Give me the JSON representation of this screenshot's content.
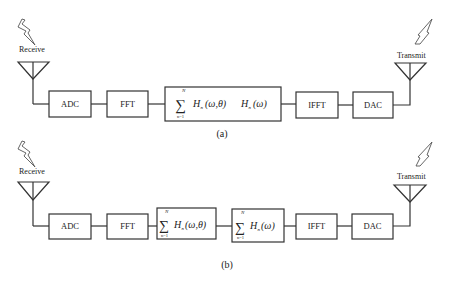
{
  "diagram_a": {
    "caption": "(a)",
    "receive_label": "Receive",
    "transmit_label": "Transmit",
    "blocks": [
      {
        "id": "adc",
        "label": "ADC"
      },
      {
        "id": "fft",
        "label": "FFT"
      },
      {
        "id": "combined_sum",
        "label": "Σ_{n=1}^{N} H_n(ω,θ) H_n(ω)",
        "sum_upper": "N",
        "sum_lower": "n=1",
        "sigma": "∑",
        "term1_H": "H",
        "term1_sub": "n",
        "term1_args": "(ω,θ)",
        "term2_H": "H",
        "term2_sub": "n",
        "term2_args": "(ω)"
      },
      {
        "id": "ifft",
        "label": "IFFT"
      },
      {
        "id": "dac",
        "label": "DAC"
      }
    ]
  },
  "diagram_b": {
    "caption": "(b)",
    "receive_label": "Receive",
    "transmit_label": "Transmit",
    "blocks": [
      {
        "id": "adc",
        "label": "ADC"
      },
      {
        "id": "fft",
        "label": "FFT"
      },
      {
        "id": "sum_theta",
        "label": "Σ_{n=1}^{N} H_n(ω,θ)",
        "sum_upper": "N",
        "sum_lower": "n=1",
        "sigma": "∑",
        "H": "H",
        "sub": "n",
        "args": "(ω,θ)"
      },
      {
        "id": "sum_omega",
        "label": "Σ_{n=1}^{N} H_n(ω)",
        "sum_upper": "N",
        "sum_lower": "n=1",
        "sigma": "∑",
        "H": "H",
        "sub": "n",
        "args": "(ω)"
      },
      {
        "id": "ifft",
        "label": "IFFT"
      },
      {
        "id": "dac",
        "label": "DAC"
      }
    ]
  }
}
